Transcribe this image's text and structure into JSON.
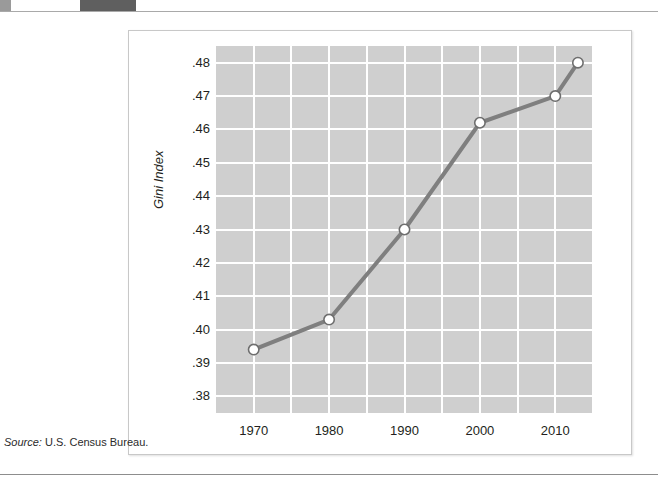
{
  "page": {
    "source_label": "Source:",
    "source_text": "U.S. Census Bureau."
  },
  "chart_data": {
    "type": "line",
    "title": "",
    "subtitle": "",
    "xlabel": "",
    "ylabel": "Gini Index",
    "x": [
      1970,
      1980,
      1990,
      2000,
      2010,
      2013
    ],
    "values": [
      0.394,
      0.403,
      0.43,
      0.462,
      0.47,
      0.48
    ],
    "series": [
      {
        "name": "Gini Index",
        "x": [
          1970,
          1980,
          1990,
          2000,
          2010,
          2013
        ],
        "values": [
          0.394,
          0.403,
          0.43,
          0.462,
          0.47,
          0.48
        ]
      }
    ],
    "xlim": [
      1965,
      2015
    ],
    "ylim": [
      0.375,
      0.485
    ],
    "xticks": [
      1970,
      1980,
      1990,
      2000,
      2010
    ],
    "xtick_labels": [
      "1970",
      "1980",
      "1990",
      "2000",
      "2010"
    ],
    "x_gridlines": [
      1970,
      1975,
      1980,
      1985,
      1990,
      1995,
      2000,
      2005,
      2010,
      2015
    ],
    "yticks": [
      0.38,
      0.39,
      0.4,
      0.41,
      0.42,
      0.43,
      0.44,
      0.45,
      0.46,
      0.47,
      0.48
    ],
    "ytick_labels": [
      ".38",
      ".39",
      ".40",
      ".41",
      ".42",
      ".43",
      ".44",
      ".45",
      ".46",
      ".47",
      ".48"
    ],
    "grid": true,
    "legend": "none",
    "marker": "open-circle",
    "colors": {
      "plot_background": "#cfcfcf",
      "gridline": "#ffffff",
      "line": "#7f7f7f",
      "marker_fill": "#ffffff",
      "marker_edge": "#6e6e6e",
      "text": "#231f20"
    }
  }
}
